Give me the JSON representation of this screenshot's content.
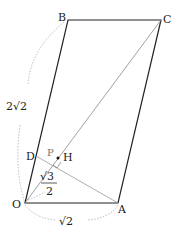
{
  "diagram": {
    "type": "geometry-parallelogram",
    "points": {
      "O": {
        "label": "O",
        "x": 25,
        "y": 203
      },
      "A": {
        "label": "A",
        "x": 118,
        "y": 203
      },
      "B": {
        "label": "B",
        "x": 68,
        "y": 20
      },
      "C": {
        "label": "C",
        "x": 161,
        "y": 20
      },
      "D": {
        "label": "D",
        "x": 36,
        "y": 156
      },
      "H": {
        "label": "H",
        "x": 58,
        "y": 158
      },
      "P": {
        "label": "P"
      }
    },
    "measurements": {
      "OB": "2√2",
      "OA": "√2",
      "OH_num": "√3",
      "OH_den": "2"
    },
    "colors": {
      "line": "#222222",
      "thin": "#999999",
      "dotted": "#aaaaaa"
    }
  }
}
